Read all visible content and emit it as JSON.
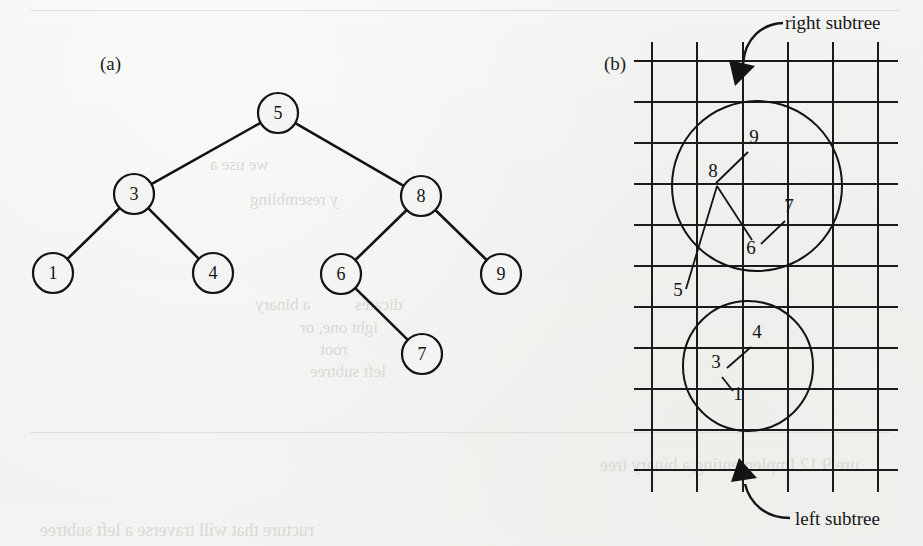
{
  "figure": {
    "panel_a_label": "(a)",
    "panel_b_label": "(b)",
    "annotations": {
      "right_subtree": "right subtree",
      "left_subtree": "left subtree"
    }
  },
  "tree": {
    "nodes": [
      {
        "id": "n5",
        "label": "5",
        "cx": 278,
        "cy": 113,
        "r": 20
      },
      {
        "id": "n3",
        "label": "3",
        "cx": 134,
        "cy": 194,
        "r": 20
      },
      {
        "id": "n8",
        "label": "8",
        "cx": 421,
        "cy": 196,
        "r": 20
      },
      {
        "id": "n1",
        "label": "1",
        "cx": 53,
        "cy": 273,
        "r": 20
      },
      {
        "id": "n4",
        "label": "4",
        "cx": 213,
        "cy": 273,
        "r": 20
      },
      {
        "id": "n6",
        "label": "6",
        "cx": 341,
        "cy": 274,
        "r": 20
      },
      {
        "id": "n9",
        "label": "9",
        "cx": 501,
        "cy": 274,
        "r": 20
      },
      {
        "id": "n7",
        "label": "7",
        "cx": 422,
        "cy": 354,
        "r": 20
      }
    ],
    "edges": [
      {
        "from": "n5",
        "to": "n3"
      },
      {
        "from": "n5",
        "to": "n8"
      },
      {
        "from": "n3",
        "to": "n1"
      },
      {
        "from": "n3",
        "to": "n4"
      },
      {
        "from": "n8",
        "to": "n6"
      },
      {
        "from": "n8",
        "to": "n9"
      },
      {
        "from": "n6",
        "to": "n7"
      }
    ]
  },
  "memory_grid": {
    "x_lines": [
      652,
      697,
      743,
      788,
      833,
      878
    ],
    "y_lines": [
      61,
      102,
      143,
      184,
      225,
      266,
      307,
      348,
      389,
      430,
      470
    ],
    "h_line_x0": 634,
    "h_line_x1": 898,
    "v_line_y0": 42,
    "v_line_y1": 492,
    "circles": [
      {
        "id": "right-subtree-circle",
        "cx": 757,
        "cy": 186,
        "r": 85
      },
      {
        "id": "left-subtree-circle",
        "cx": 748,
        "cy": 366,
        "r": 65
      }
    ],
    "labels": [
      {
        "id": "g9",
        "text": "9",
        "x": 754,
        "y": 143,
        "lx1": 748,
        "ly1": 152,
        "lx2": 716,
        "ly2": 183
      },
      {
        "id": "g8",
        "text": "8",
        "x": 713,
        "y": 177,
        "lx1": 717,
        "ly1": 186,
        "lx2": 752,
        "ly2": 240
      },
      {
        "id": "g7",
        "text": "7",
        "x": 789,
        "y": 212,
        "lx1": 785,
        "ly1": 221,
        "lx2": 761,
        "ly2": 244
      },
      {
        "id": "g6",
        "text": "6",
        "x": 751,
        "y": 254,
        "lx1": 0,
        "ly1": 0,
        "lx2": 0,
        "ly2": 0
      },
      {
        "id": "g5",
        "text": "5",
        "x": 678,
        "y": 296,
        "lx1": 686,
        "ly1": 289,
        "lx2": 717,
        "ly2": 186
      },
      {
        "id": "g4",
        "text": "4",
        "x": 757,
        "y": 338,
        "lx1": 751,
        "ly1": 347,
        "lx2": 727,
        "ly2": 368
      },
      {
        "id": "g3",
        "text": "3",
        "x": 716,
        "y": 368,
        "lx1": 0,
        "ly1": 0,
        "lx2": 0,
        "ly2": 0
      },
      {
        "id": "g1",
        "text": "1",
        "x": 738,
        "y": 400,
        "lx1": 733,
        "ly1": 391,
        "lx2": 722,
        "ly2": 377
      }
    ]
  },
  "bleed_through": {
    "lines": [
      {
        "text": "ure 9.12   Implementing a binary tree",
        "x": 600,
        "y": 455,
        "size": 18
      },
      {
        "text": "a binary",
        "x": 255,
        "y": 295,
        "size": 17
      },
      {
        "text": "dicates",
        "x": 355,
        "y": 295,
        "size": 17
      },
      {
        "text": "ight one, or",
        "x": 300,
        "y": 318,
        "size": 17
      },
      {
        "text": "root",
        "x": 320,
        "y": 340,
        "size": 17
      },
      {
        "text": "left subtree",
        "x": 310,
        "y": 362,
        "size": 17
      },
      {
        "text": "ructure that will traverse a left subtree",
        "x": 40,
        "y": 520,
        "size": 18
      },
      {
        "text": "we use a",
        "x": 210,
        "y": 155,
        "size": 17
      },
      {
        "text": "y resembling",
        "x": 250,
        "y": 190,
        "size": 17
      }
    ],
    "rules": [
      {
        "x": 30,
        "y": 10,
        "w": 870
      },
      {
        "x": 30,
        "y": 432,
        "w": 860
      }
    ]
  }
}
